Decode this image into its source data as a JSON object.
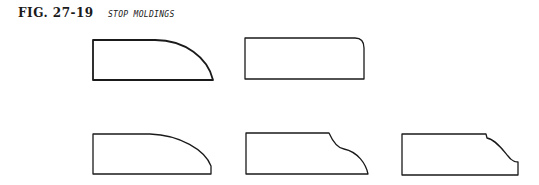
{
  "figure": {
    "label": "FIG. 27-19",
    "title": "STOP MOLDINGS"
  },
  "profiles": [
    {
      "id": "quarter-round-large",
      "description": "Rectangle with large convex curved top-right edge",
      "row": 1,
      "col": 1
    },
    {
      "id": "rounded-corner",
      "description": "Rectangle with small rounded top-right corner",
      "row": 1,
      "col": 2
    },
    {
      "id": "quarter-round-fillet",
      "description": "Rectangle with convex curve ending in short vertical fillet",
      "row": 2,
      "col": 1
    },
    {
      "id": "ogee",
      "description": "Rectangle with ogee (S-curve) right edge",
      "row": 2,
      "col": 2
    },
    {
      "id": "ogee-stepped",
      "description": "Rectangle with stepped ogee right edge and bottom fillet",
      "row": 2,
      "col": 3
    }
  ],
  "colors": {
    "ink": "#1a1a1a",
    "paper": "#ffffff"
  }
}
